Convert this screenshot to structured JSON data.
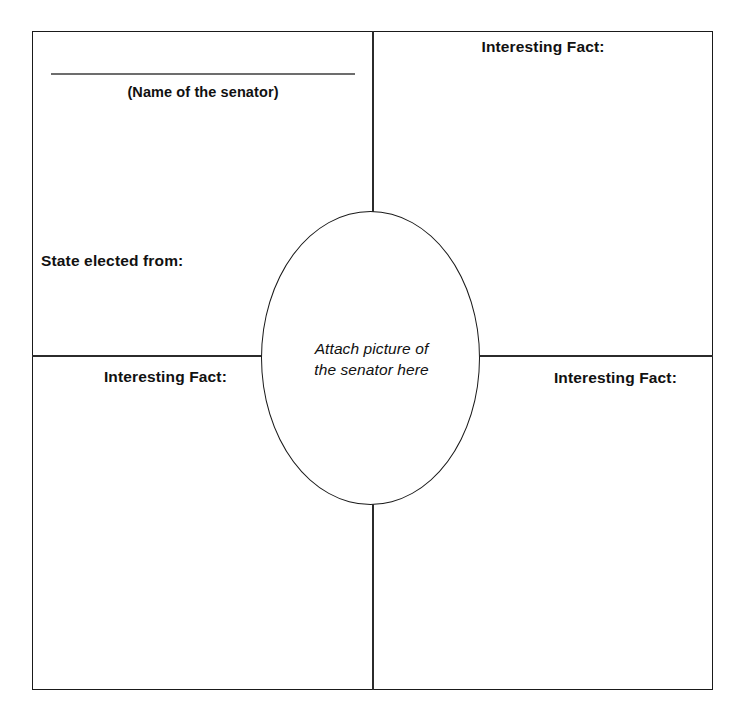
{
  "worksheet": {
    "title_blank": {
      "caption": "(Name of the senator)"
    },
    "center": {
      "line1": "Attach picture of",
      "line2": "the senator here"
    },
    "quadrants": {
      "top_left": {
        "state_label": "State elected from:"
      },
      "top_right": {
        "label": "Interesting Fact:"
      },
      "bottom_left": {
        "label": "Interesting Fact:"
      },
      "bottom_right": {
        "label": "Interesting Fact:"
      }
    }
  },
  "colors": {
    "border": "#1a1a1a",
    "divider": "#2b2b2b",
    "blank_line": "#6d6d6d",
    "text": "#111111",
    "background": "#ffffff"
  }
}
